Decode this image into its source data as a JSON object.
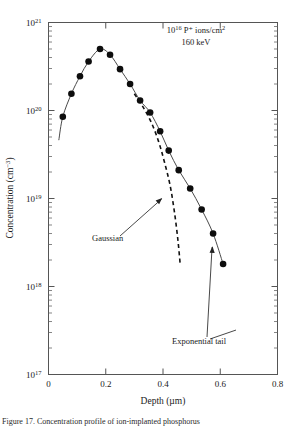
{
  "chart_data": {
    "type": "scatter",
    "title": "",
    "xlabel": "Depth (µm)",
    "ylabel": "Concentration (cm⁻³)",
    "xlim": [
      0,
      0.8
    ],
    "ylim": [
      1e+17,
      1e+21
    ],
    "yscale": "log",
    "xscale": "linear",
    "grid": false,
    "legend": "none",
    "xticks": [
      0,
      0.2,
      0.4,
      0.6,
      0.8
    ],
    "xtick_labels": [
      "0",
      "0.2",
      "0.4",
      "0.6",
      "0.8"
    ],
    "ytick_labels": [
      "10¹⁷",
      "10¹⁸",
      "10¹⁹",
      "10²⁰",
      "10²¹"
    ],
    "ytick_bases": [
      "10",
      "10",
      "10",
      "10",
      "10"
    ],
    "ytick_exponents": [
      "17",
      "18",
      "19",
      "20",
      "21"
    ],
    "series": [
      {
        "name": "measured profile",
        "style": "filled-circle markers with solid connecting curve",
        "points": [
          {
            "x": 0.05,
            "y": 8.5e+19
          },
          {
            "x": 0.08,
            "y": 1.55e+20
          },
          {
            "x": 0.11,
            "y": 2.45e+20
          },
          {
            "x": 0.14,
            "y": 3.6e+20
          },
          {
            "x": 0.18,
            "y": 5e+20
          },
          {
            "x": 0.215,
            "y": 4.3e+20
          },
          {
            "x": 0.25,
            "y": 2.95e+20
          },
          {
            "x": 0.285,
            "y": 2e+20
          },
          {
            "x": 0.32,
            "y": 1.3e+20
          },
          {
            "x": 0.355,
            "y": 9.5e+19
          },
          {
            "x": 0.39,
            "y": 5.8e+19
          },
          {
            "x": 0.42,
            "y": 3.5e+19
          },
          {
            "x": 0.455,
            "y": 2.1e+19
          },
          {
            "x": 0.495,
            "y": 1.3e+19
          },
          {
            "x": 0.535,
            "y": 7.5e+18
          },
          {
            "x": 0.575,
            "y": 4e+18
          },
          {
            "x": 0.61,
            "y": 1.8e+18
          }
        ]
      },
      {
        "name": "Gaussian fit",
        "style": "dashed",
        "points": [
          {
            "x": 0.3,
            "y": 1.55e+20
          },
          {
            "x": 0.33,
            "y": 1.1e+20
          },
          {
            "x": 0.36,
            "y": 7.2e+19
          },
          {
            "x": 0.385,
            "y": 4.4e+19
          },
          {
            "x": 0.405,
            "y": 2.6e+19
          },
          {
            "x": 0.425,
            "y": 1.4e+19
          },
          {
            "x": 0.44,
            "y": 7e+18
          },
          {
            "x": 0.452,
            "y": 3.4e+18
          },
          {
            "x": 0.46,
            "y": 1.8e+18
          }
        ]
      }
    ],
    "annotations": [
      {
        "name": "implant-conditions",
        "line1_base": "10",
        "line1_exp": "16",
        "line1_rest": " P⁺ ions/cm",
        "line1_rest_exp": "2",
        "line2": "160 keV",
        "x": 0.47,
        "y": 6e+20
      },
      {
        "name": "gaussian-label",
        "text": "Gaussian",
        "points_to": {
          "x": 0.4,
          "y": 1.05e+19
        }
      },
      {
        "name": "exponential-tail-label",
        "text": "Exponential tail",
        "points_to": {
          "x": 0.575,
          "y": 3e+18
        }
      }
    ]
  },
  "caption": {
    "text": "Figure 17. Concentration profile of ion-implanted phosphorus"
  }
}
